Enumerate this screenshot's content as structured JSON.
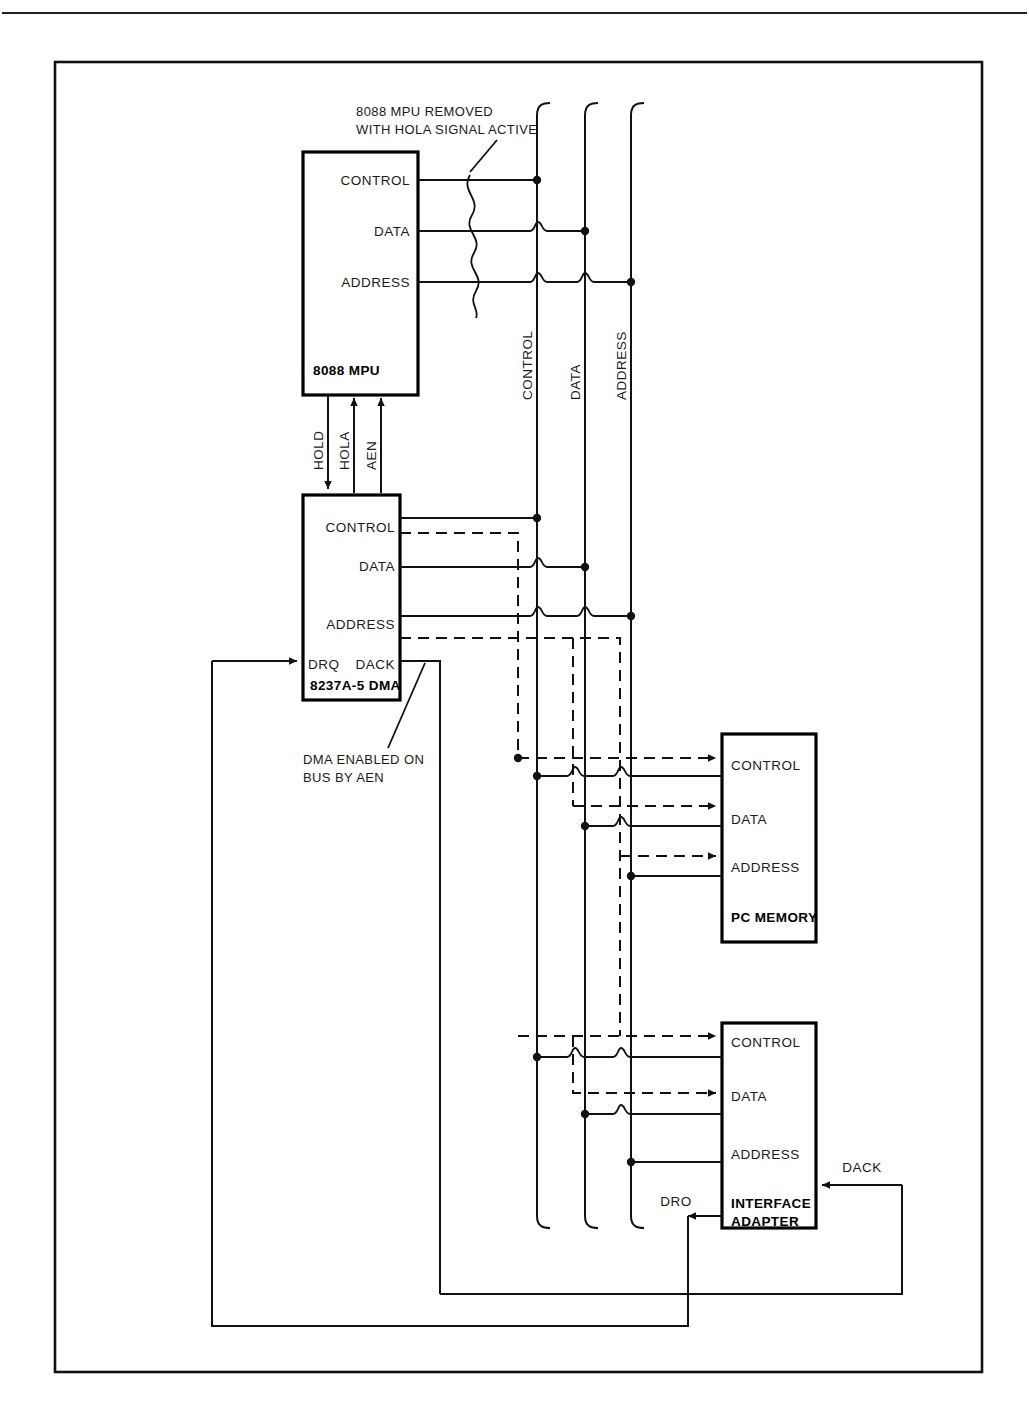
{
  "page": {
    "background": "#ffffff",
    "ink": "#111111",
    "header_rule": true
  },
  "blocks": [
    {
      "id": "mpu",
      "title": "8088 MPU",
      "pins": [
        "CONTROL",
        "DATA",
        "ADDRESS"
      ]
    },
    {
      "id": "dma",
      "title": "8237A-5 DMA",
      "pins": [
        "CONTROL",
        "DATA",
        "ADDRESS"
      ],
      "left_pin": "DRQ",
      "right_pin": "DACK"
    },
    {
      "id": "memory",
      "title": "PC MEMORY",
      "pins": [
        "CONTROL",
        "DATA",
        "ADDRESS"
      ]
    },
    {
      "id": "interface",
      "title_line1": "INTERFACE",
      "title_line2": "ADAPTER",
      "pins": [
        "CONTROL",
        "DATA",
        "ADDRESS"
      ],
      "req_pin": "DRO",
      "ack_pin": "DACK"
    }
  ],
  "buses": [
    {
      "name": "CONTROL"
    },
    {
      "name": "DATA"
    },
    {
      "name": "ADDRESS"
    }
  ],
  "signals": {
    "hold": "HOLD",
    "hola": "HOLA",
    "aen": "AEN"
  },
  "annotations": {
    "mpu_removed_line1": "8088 MPU REMOVED",
    "mpu_removed_line2": "WITH HOLA SIGNAL ACTIVE",
    "dma_enabled_line1": "DMA ENABLED ON",
    "dma_enabled_line2": "BUS BY AEN"
  }
}
